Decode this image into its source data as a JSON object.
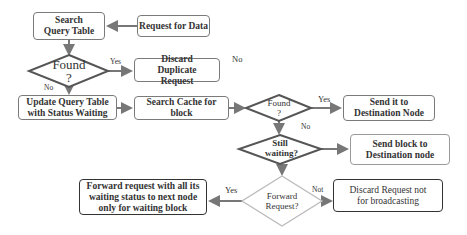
{
  "diagram": {
    "nodes": {
      "search_query_table": "Search Query Table",
      "request_for_data": "Request for Data",
      "found_1": "Found ?",
      "discard_duplicate": "Discard Duplicate Request",
      "update_query_table": "Update Query Table with Status Waiting",
      "search_cache": "Search Cache for block",
      "found_2": "Found ?",
      "send_it_destination": "Send it to Destination Node",
      "still_waiting": "Still waiting?",
      "send_block_destination": "Send block to Destination node",
      "forward_request_decision": "Forward Request?",
      "forward_request_action": "Forward request with all its waiting status to next node only for waiting block",
      "discard_request": "Discard Request not for broadcasting"
    },
    "edge_labels": {
      "found1_yes": "Yes",
      "found1_no": "No",
      "top_no": "No",
      "found2_yes": "Yes",
      "found2_no": "No",
      "forward_yes": "Yes",
      "forward_not": "Not"
    }
  }
}
